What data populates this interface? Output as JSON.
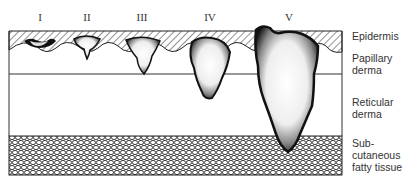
{
  "figure": {
    "type": "Clark levels of melanoma invasion",
    "levels": [
      {
        "label": "I",
        "x": 40
      },
      {
        "label": "II",
        "x": 87
      },
      {
        "label": "III",
        "x": 142
      },
      {
        "label": "IV",
        "x": 210
      },
      {
        "label": "V",
        "x": 289
      }
    ],
    "layers": [
      {
        "id": "epidermis",
        "lines": [
          "Epidermis"
        ],
        "y": 30
      },
      {
        "id": "papillary-derma",
        "lines": [
          "Papillary",
          "derma"
        ],
        "y": 52
      },
      {
        "id": "reticular-derma",
        "lines": [
          "Reticular",
          "derma"
        ],
        "y": 98
      },
      {
        "id": "subcutaneous-fatty-tissue",
        "lines": [
          "Sub-",
          "cutaneous",
          "fatty tissue"
        ],
        "y": 138
      }
    ]
  }
}
